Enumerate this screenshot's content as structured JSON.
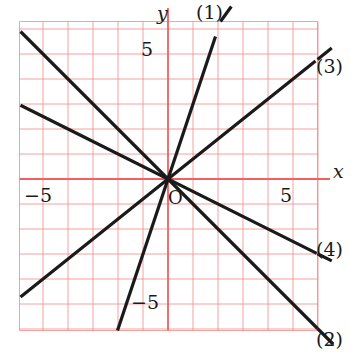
{
  "chart_data": {
    "type": "line",
    "title": "",
    "xlabel": "x",
    "ylabel": "y",
    "origin_label": "O",
    "xlim": [
      -5.9,
      7.8
    ],
    "ylim": [
      -7.4,
      6.3
    ],
    "grid": true,
    "grid_color": "#f08080",
    "grid_step": 1,
    "axis_color": "#f26060",
    "line_color": "#1a1a1a",
    "legend_position": "line-ends",
    "xticks": [
      -5,
      5
    ],
    "xtick_labels": [
      "−5",
      "5"
    ],
    "yticks": [
      5,
      -5
    ],
    "ytick_labels": [
      "5",
      "−5"
    ],
    "series": [
      {
        "name": "(1)",
        "equation": "y = 3x",
        "slope": 3,
        "intercept": 0,
        "x_from": -2.05,
        "x_to": 1.9
      },
      {
        "name": "(2)",
        "equation": "y = −x",
        "slope": -1,
        "intercept": 0,
        "x_from": -5.9,
        "x_to": 6.0
      },
      {
        "name": "(3)",
        "equation": "y = (4/5)x",
        "slope": 0.8,
        "intercept": 0,
        "x_from": -5.9,
        "x_to": 5.9
      },
      {
        "name": "(4)",
        "equation": "y = −(1/2)x",
        "slope": -0.5,
        "intercept": 0,
        "x_from": -5.9,
        "x_to": 5.95
      }
    ]
  },
  "labels": {
    "y_axis": "y",
    "x_axis": "x",
    "origin": "O",
    "y_five": "5",
    "y_minus_five": "−5",
    "x_five": "5",
    "x_minus_five": "−5",
    "series1": "(1)",
    "series2": "(2)",
    "series3": "(3)",
    "series4": "(4)"
  }
}
